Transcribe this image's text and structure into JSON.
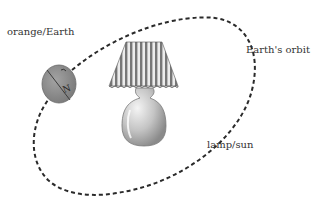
{
  "diagram": {
    "labels": {
      "earth": "orange/Earth",
      "orbit": "Earth's orbit",
      "sun": "lamp/sun"
    },
    "earth_pole_label": "N",
    "colors": {
      "orbit": "#2a2a2a",
      "earth_fill": "#8f8f8f",
      "shade_stripe_dark": "#6a6a6a",
      "shade_stripe_light": "#e8e8e8",
      "lamp_base": "#bdbdbd",
      "text": "#333333"
    }
  }
}
